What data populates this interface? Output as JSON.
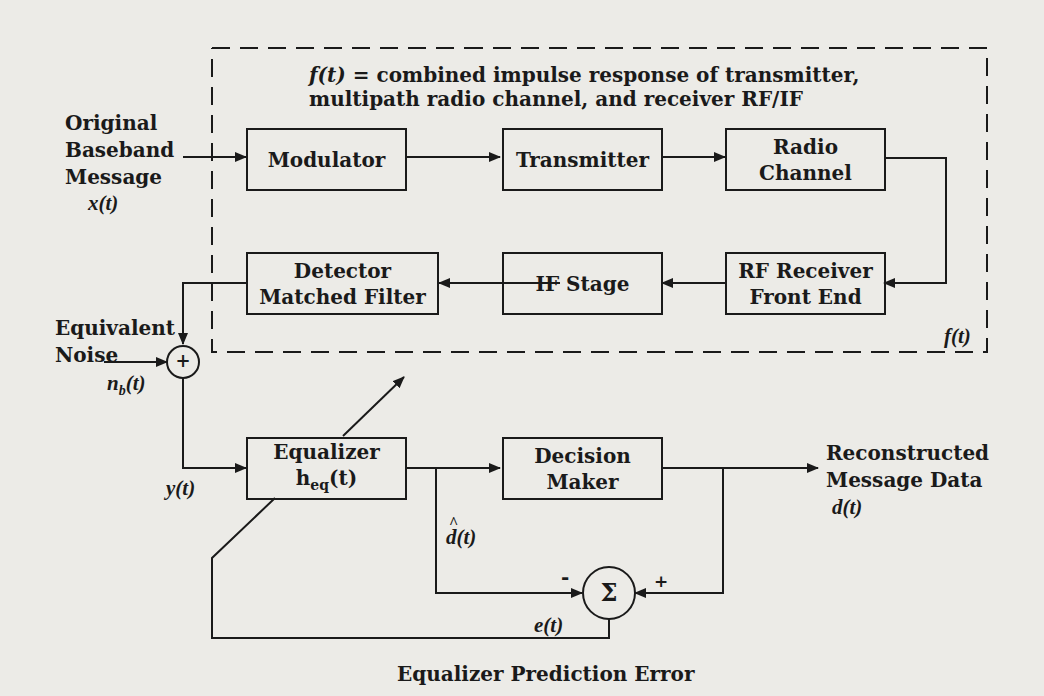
{
  "diagram": {
    "title_expr": "f(t)",
    "title_line1": " = combined impulse response of transmitter,",
    "title_line2": "multipath radio channel, and receiver RF/IF",
    "channel_label": "f(t)",
    "blocks": {
      "modulator": "Modulator",
      "transmitter": "Transmitter",
      "radio_channel": [
        "Radio",
        "Channel"
      ],
      "rf_receiver": [
        "RF Receiver",
        "Front End"
      ],
      "if_stage": "IF Stage",
      "detector": [
        "Detector",
        "Matched Filter"
      ],
      "equalizer": [
        "Equalizer",
        "h",
        "eq",
        "(t)"
      ],
      "decision_maker": [
        "Decision",
        "Maker"
      ],
      "summer": "Σ",
      "adder": "+"
    },
    "signals": {
      "input": [
        "Original",
        "Baseband",
        "Message"
      ],
      "input_var": "x(t)",
      "noise": [
        "Equivalent",
        "Noise"
      ],
      "noise_var": "n",
      "noise_sub": "b",
      "noise_tail": "(t)",
      "equalizer_in": "y(t)",
      "d_hat": "d(t)",
      "d_hat_accent": "^",
      "output": [
        "Reconstructed",
        "Message Data"
      ],
      "output_var": "d(t)",
      "error": "e(t)",
      "minus": "-",
      "plus": "+"
    },
    "caption": "Equalizer Prediction Error"
  }
}
